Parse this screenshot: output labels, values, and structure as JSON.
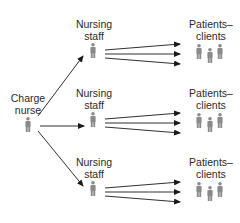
{
  "diagram": {
    "type": "hierarchy-flow",
    "colors": {
      "person_fill": "#8a8a8a",
      "arrow": "#1a1a1a",
      "text": "#2b2b2b"
    },
    "charge_nurse": {
      "line1": "Charge",
      "line2": "nurse"
    },
    "rows": [
      {
        "staff": {
          "line1": "Nursing",
          "line2": "staff"
        },
        "patients": {
          "line1": "Patients–",
          "line2": "clients"
        }
      },
      {
        "staff": {
          "line1": "Nursing",
          "line2": "staff"
        },
        "patients": {
          "line1": "Patients–",
          "line2": "clients"
        }
      },
      {
        "staff": {
          "line1": "Nursing",
          "line2": "staff"
        },
        "patients": {
          "line1": "Patients–",
          "line2": "clients"
        }
      }
    ]
  }
}
